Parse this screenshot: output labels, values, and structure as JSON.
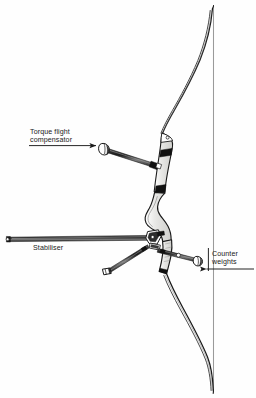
{
  "figure": {
    "background_color": "#fefefe",
    "ink_color": "#1a1a1a",
    "riser_fill_color": "#e3e3e1",
    "band_color": "#111111",
    "width": 256,
    "height": 398
  },
  "labels": {
    "torque_flight_compensator": {
      "line1": "Torque flight",
      "line2": "compensator"
    },
    "stabiliser": {
      "line1": "Stabiliser"
    },
    "counter_weights": {
      "line1": "Counter",
      "line2": "weights"
    }
  },
  "parts": {
    "bowstring": "bowstring",
    "upper_limb": "upper-limb",
    "lower_limb": "lower-limb",
    "riser": "riser",
    "grip": "grip",
    "compensator_rod": "compensator-rod",
    "compensator_weight": "compensator-weight",
    "stabiliser_rod": "stabiliser-rod",
    "stabiliser_end_cap": "stabiliser-end-cap",
    "v_bar_left_rod": "v-bar-left-rod",
    "v_bar_left_weight": "v-bar-left-weight",
    "v_bar_right_rod": "v-bar-right-rod",
    "v_bar_right_weight": "v-bar-right-weight",
    "mounting_block": "mounting-block"
  }
}
